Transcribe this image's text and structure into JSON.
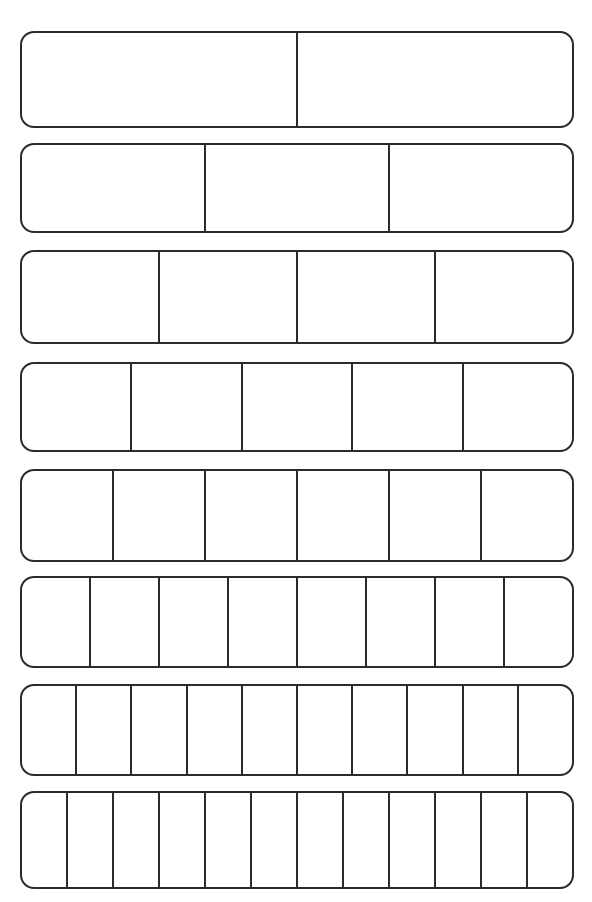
{
  "page": {
    "background_color": "#ffffff",
    "line_color": "#2b2b2b",
    "width": 592,
    "height": 902
  },
  "chart_data": {
    "type": "bar",
    "subtitle": "",
    "xlabel": "",
    "ylabel": "",
    "grid": false,
    "legend": "none",
    "orientation": "horizontal",
    "categories": [
      "1/2",
      "1/3",
      "1/4",
      "1/5",
      "1/6",
      "1/8",
      "1/10",
      "1/12"
    ],
    "values": [
      2,
      3,
      4,
      5,
      6,
      8,
      10,
      12
    ],
    "xlim": [
      0,
      1
    ],
    "ylim": [
      0,
      8
    ]
  },
  "strips": [
    {
      "index": 1,
      "name": "halves",
      "parts": 2,
      "fraction_label": "1/2",
      "left": 20,
      "top": 31,
      "width": 554,
      "height": 97,
      "cells": [
        "",
        ""
      ]
    },
    {
      "index": 2,
      "name": "thirds",
      "parts": 3,
      "fraction_label": "1/3",
      "left": 20,
      "top": 143,
      "width": 554,
      "height": 90,
      "cells": [
        "",
        "",
        ""
      ]
    },
    {
      "index": 3,
      "name": "fourths",
      "parts": 4,
      "fraction_label": "1/4",
      "left": 20,
      "top": 250,
      "width": 554,
      "height": 94,
      "cells": [
        "",
        "",
        "",
        ""
      ]
    },
    {
      "index": 4,
      "name": "fifths",
      "parts": 5,
      "fraction_label": "1/5",
      "left": 20,
      "top": 362,
      "width": 554,
      "height": 90,
      "cells": [
        "",
        "",
        "",
        "",
        ""
      ]
    },
    {
      "index": 5,
      "name": "sixths",
      "parts": 6,
      "fraction_label": "1/6",
      "left": 20,
      "top": 469,
      "width": 554,
      "height": 93,
      "cells": [
        "",
        "",
        "",
        "",
        "",
        ""
      ]
    },
    {
      "index": 6,
      "name": "eighths",
      "parts": 8,
      "fraction_label": "1/8",
      "left": 20,
      "top": 576,
      "width": 554,
      "height": 92,
      "cells": [
        "",
        "",
        "",
        "",
        "",
        "",
        "",
        ""
      ]
    },
    {
      "index": 7,
      "name": "tenths",
      "parts": 10,
      "fraction_label": "1/10",
      "left": 20,
      "top": 684,
      "width": 554,
      "height": 92,
      "cells": [
        "",
        "",
        "",
        "",
        "",
        "",
        "",
        "",
        "",
        ""
      ]
    },
    {
      "index": 8,
      "name": "twelfths",
      "parts": 12,
      "fraction_label": "1/12",
      "left": 20,
      "top": 791,
      "width": 554,
      "height": 98,
      "cells": [
        "",
        "",
        "",
        "",
        "",
        "",
        "",
        "",
        "",
        "",
        "",
        ""
      ]
    }
  ]
}
